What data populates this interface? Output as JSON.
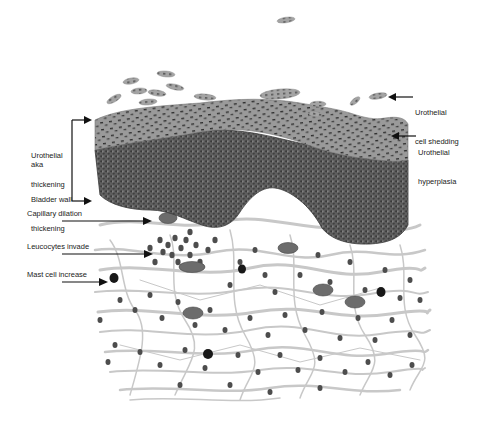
{
  "diagram": {
    "colors": {
      "background": "#ffffff",
      "urothelium_superficial": "#9a9a9a",
      "urothelium_basal": "#5a5a5a",
      "nuclei": "#333333",
      "stroma_fibers": "#c4c4c4",
      "inflammatory_cells": "#4a4a4a",
      "mast_cells": "#151515",
      "arrows": "#111111",
      "text": "#222222"
    },
    "labels": {
      "left_bracket": {
        "line1": "Urothelial",
        "line2": "thickening",
        "aka": "aka",
        "line3": "Bladder wall",
        "line4": "thickening"
      },
      "capillary": "Capillary dilation",
      "leucocytes": "Leucocytes invade",
      "mast": "Mast cell increase",
      "shedding_line1": "Urothelial",
      "shedding_line2": "cell shedding",
      "hyperplasia_line1": "Urothelial",
      "hyperplasia_line2": "hyperplasia"
    }
  }
}
